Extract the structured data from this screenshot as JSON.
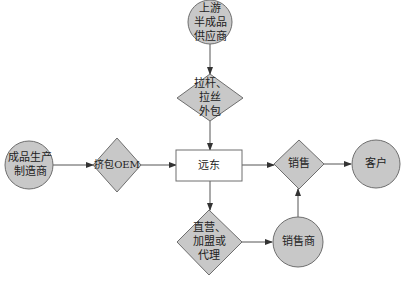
{
  "diagram": {
    "colors": {
      "node_fill": "#c8c8c8",
      "node_stroke": "#6e6e6e",
      "box_fill": "#ffffff",
      "edge": "#555555",
      "text": "#222222"
    },
    "nodes": {
      "upstream_supplier": {
        "shape": "circle",
        "label": "上游\n半成品\n供应商"
      },
      "drawbar_outsourcing": {
        "shape": "diamond",
        "label": "拉杆、\n拉丝\n外包"
      },
      "finished_goods_maker": {
        "shape": "circle",
        "label": "成品生产\n制造商"
      },
      "oem_packaging": {
        "shape": "diamond",
        "label": "挤包OEM"
      },
      "yuandong": {
        "shape": "rectangle",
        "label": "远东"
      },
      "sales": {
        "shape": "diamond",
        "label": "销售"
      },
      "customer": {
        "shape": "circle",
        "label": "客户"
      },
      "direct_franchise_agency": {
        "shape": "diamond",
        "label": "直营、\n加盟或\n代理"
      },
      "distributor": {
        "shape": "circle",
        "label": "销售商"
      }
    },
    "edges": [
      {
        "from": "upstream_supplier",
        "to": "drawbar_outsourcing"
      },
      {
        "from": "drawbar_outsourcing",
        "to": "yuandong"
      },
      {
        "from": "finished_goods_maker",
        "to": "oem_packaging"
      },
      {
        "from": "oem_packaging",
        "to": "yuandong"
      },
      {
        "from": "yuandong",
        "to": "sales"
      },
      {
        "from": "sales",
        "to": "customer"
      },
      {
        "from": "yuandong",
        "to": "direct_franchise_agency"
      },
      {
        "from": "direct_franchise_agency",
        "to": "distributor"
      },
      {
        "from": "distributor",
        "to": "sales"
      }
    ]
  }
}
